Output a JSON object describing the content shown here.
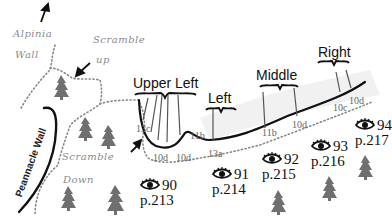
{
  "map": {
    "type": "climbing-topo",
    "features": {
      "alpinia_wall": "Alpinia Wall",
      "scramble_up_1": "Scramble",
      "scramble_up_2": "up",
      "scramble_down_1": "Scramble",
      "scramble_down_2": "Down",
      "pinnacle_wall": "Peannacle Wall"
    },
    "areas": {
      "upper_left": "Upper Left",
      "left": "Left",
      "middle": "Middle",
      "right": "Right"
    },
    "grades": [
      {
        "text": "13c",
        "x": 136,
        "y": 125
      },
      {
        "text": "10d",
        "x": 154,
        "y": 153
      },
      {
        "text": "10d",
        "x": 176,
        "y": 153
      },
      {
        "text": "11b",
        "x": 190,
        "y": 131
      },
      {
        "text": "13a",
        "x": 208,
        "y": 151
      },
      {
        "text": "11b",
        "x": 262,
        "y": 130
      },
      {
        "text": "10d",
        "x": 292,
        "y": 122
      },
      {
        "text": "10c",
        "x": 333,
        "y": 105
      },
      {
        "text": "10d",
        "x": 349,
        "y": 97
      }
    ],
    "route_refs": [
      {
        "num": "90",
        "page": "p.213",
        "x": 140,
        "y": 178
      },
      {
        "num": "91",
        "page": "p.214",
        "x": 213,
        "y": 168
      },
      {
        "num": "92",
        "page": "p.215",
        "x": 262,
        "y": 154
      },
      {
        "num": "93",
        "page": "p.216",
        "x": 312,
        "y": 141
      },
      {
        "num": "94",
        "page": "p.217",
        "x": 357,
        "y": 122
      }
    ],
    "colors": {
      "ink": "#111111",
      "tree": "#6f6f6f",
      "trail": "#888888",
      "handwriting": "#8a8a8a"
    }
  }
}
